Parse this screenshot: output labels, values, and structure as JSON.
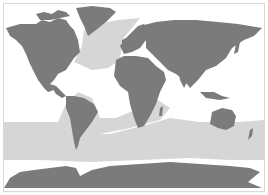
{
  "map": {
    "type": "world-map",
    "style": "grayscale",
    "colors": {
      "background": "#ffffff",
      "land": "#7b7b7b",
      "highlight_region": "#d6d6d6",
      "border": "#d8d8d8"
    },
    "regions": [
      {
        "name": "north-atlantic-band",
        "shade": "highlight"
      },
      {
        "name": "southern-ocean-band",
        "shade": "highlight"
      },
      {
        "name": "south-atlantic-diagonal-band",
        "shade": "highlight"
      }
    ],
    "labels": [
      {
        "id": "arctic-sea-label",
        "text": "····"
      }
    ]
  }
}
